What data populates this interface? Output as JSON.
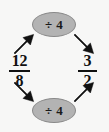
{
  "diagram": {
    "type": "fraction-simplification",
    "background_color": "#f7f7f6",
    "ink_color": "#111111",
    "bubble_fill": "#b3b3b3",
    "bubble_stroke": "#8a8a8a",
    "source_fraction": {
      "numerator": "12",
      "denominator": "8",
      "value_label": "12/8"
    },
    "result_fraction": {
      "numerator": "3",
      "denominator": "2",
      "value_label": "3/2"
    },
    "operations": [
      {
        "id": "op-top",
        "label": "÷ 4",
        "operator": "÷",
        "operand": "4",
        "applies_to": "numerator",
        "position": "top"
      },
      {
        "id": "op-bottom",
        "label": "÷ 4",
        "operator": "÷",
        "operand": "4",
        "applies_to": "denominator",
        "position": "bottom"
      }
    ],
    "arrows": [
      {
        "id": "arrow-top-left",
        "direction": "up-right",
        "from": "source-fraction-numerator",
        "to": "op-top"
      },
      {
        "id": "arrow-top-right",
        "direction": "down-right",
        "from": "op-top",
        "to": "result-fraction-numerator"
      },
      {
        "id": "arrow-bottom-left",
        "direction": "down-right",
        "from": "source-fraction-denominator",
        "to": "op-bottom"
      },
      {
        "id": "arrow-bottom-right",
        "direction": "up-right",
        "from": "op-bottom",
        "to": "result-fraction-denominator"
      }
    ]
  }
}
